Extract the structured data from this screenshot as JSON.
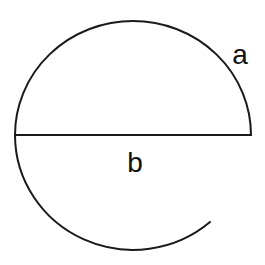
{
  "diagram": {
    "labels": {
      "arc": "a",
      "diameter": "b"
    },
    "elements": [
      {
        "name": "upper-arc",
        "label": "a",
        "type": "semicircular arc"
      },
      {
        "name": "diameter-line",
        "label": "b",
        "type": "line segment"
      },
      {
        "name": "lower-arc",
        "label": "",
        "type": "partial arc"
      }
    ],
    "colors": {
      "stroke": "#1a1a1a",
      "background": "#ffffff"
    }
  }
}
